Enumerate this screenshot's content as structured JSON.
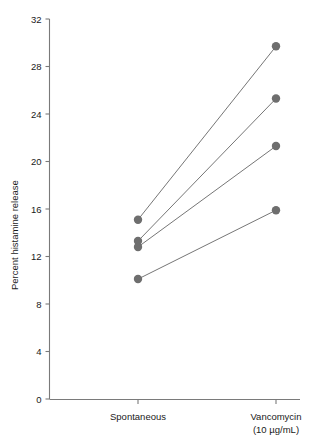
{
  "chart_data": {
    "type": "line",
    "title": "",
    "subtitle": "",
    "xlabel": "",
    "ylabel": "Percent histamine release",
    "categories": [
      "Spontaneous",
      "Vancomycin"
    ],
    "category_sublabels": [
      "",
      "(10 µg/mL)"
    ],
    "ylim": [
      0,
      32
    ],
    "yticks": [
      0,
      4,
      8,
      12,
      16,
      20,
      24,
      28,
      32
    ],
    "ytick_labels": [
      "0",
      "4",
      "8",
      "12",
      "16",
      "20",
      "24",
      "28",
      "32"
    ],
    "grid": false,
    "legend": false,
    "legend_position": "none",
    "marker": "circle",
    "marker_color": "#6e6e6e",
    "line_color": "#767676",
    "series": [
      {
        "name": "Donor 1",
        "values": [
          15.1,
          29.7
        ]
      },
      {
        "name": "Donor 2",
        "values": [
          13.3,
          25.3
        ]
      },
      {
        "name": "Donor 3",
        "values": [
          12.8,
          21.3
        ]
      },
      {
        "name": "Donor 4",
        "values": [
          10.1,
          15.9
        ]
      }
    ]
  },
  "axes": {
    "y_title": "Percent histamine release",
    "x_cat_1": "Spontaneous",
    "x_cat_2": "Vancomycin",
    "x_cat_2_sub": "(10 µg/mL)"
  },
  "colors": {
    "marker": "#6e6e6e",
    "line": "#767676",
    "axis": "#7a7a7a",
    "text": "#1a1a1a",
    "background": "#ffffff"
  }
}
